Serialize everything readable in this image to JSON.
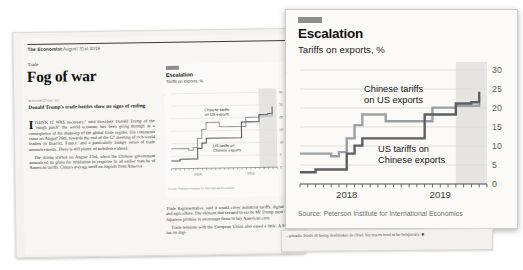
{
  "magazine": {
    "masthead_name": "The Economist",
    "masthead_date": "August 31st 2019",
    "kicker": "Trade",
    "headline": "Fog of war",
    "dateline": "WASHINGTON, DC",
    "standfirst": "Donald Trump's trade battles show no signs of ending",
    "body_left_1": "THINK IT WAS necessary,\" said President Donald Trump of the \"rough patch\" the world economy has been going through as a consequence of his shake-up of the global trade regime. His comments came on August 26th, towards the end of the G7 meeting of rich-world leaders in Biarritz, France, and a particularly bumpy series of trade announcements. There is still plenty of turbulence ahead.",
    "body_left_2": "The drama started on August 23rd, when the Chinese government announced its plans for retaliation in response to an earlier tranche of American tariffs. China's average tariff on imports from America",
    "dropcap": "I",
    "body_right_1": "Trade Representative, said it would cover industrial tariffs, digital trade and agriculture. The element that seemed to excite Mr Trump most was a Japanese promise to encourage firms to buy American corn.",
    "body_right_2": "Trade tensions with the European Union also eased a little. A French tax on digi-",
    "note_strip": "...poradic bouts of being dealmaker-in-chief, his truces tend to be temporary. ■"
  },
  "chart_data": {
    "type": "line",
    "step": true,
    "title": "Escalation",
    "subtitle": "Tariffs on exports, %",
    "source": "Source: Peterson Institute for International Economics",
    "forecast_label": "Forecast",
    "xlabel": "",
    "ylabel": "",
    "ylim": [
      0,
      30
    ],
    "yticks": [
      0,
      5,
      10,
      15,
      20,
      25,
      30
    ],
    "ytick_labels": [
      "0",
      "5",
      "10",
      "15",
      "20",
      "25",
      "30"
    ],
    "xlim": [
      "2018-01",
      "2020-01"
    ],
    "xtick_labels": [
      "2018",
      "2019"
    ],
    "grid": true,
    "legend_position": "inline-annotations",
    "forecast_band": {
      "start": "2019-09",
      "end": "2020-01",
      "color": "#e6e4e0"
    },
    "series": [
      {
        "name": "Chinese tariffs on US exports",
        "color": "#9aa0a3",
        "annotation": "Chinese tariffs\non US exports",
        "points": [
          {
            "x": "2018-01",
            "y": 8.0
          },
          {
            "x": "2018-04",
            "y": 8.0
          },
          {
            "x": "2018-05",
            "y": 7.3
          },
          {
            "x": "2018-06",
            "y": 8.4
          },
          {
            "x": "2018-07",
            "y": 12.0
          },
          {
            "x": "2018-08",
            "y": 15.5
          },
          {
            "x": "2018-09",
            "y": 18.3
          },
          {
            "x": "2018-12",
            "y": 16.5
          },
          {
            "x": "2019-06",
            "y": 20.1
          },
          {
            "x": "2019-09",
            "y": 20.6
          },
          {
            "x": "2019-12",
            "y": 21.2
          }
        ]
      },
      {
        "name": "US tariffs on Chinese exports",
        "color": "#5c5f63",
        "annotation": "US tariffs on\nChinese exports",
        "points": [
          {
            "x": "2018-01",
            "y": 3.1
          },
          {
            "x": "2018-03",
            "y": 3.8
          },
          {
            "x": "2018-07",
            "y": 8.0
          },
          {
            "x": "2018-08",
            "y": 10.1
          },
          {
            "x": "2018-09",
            "y": 12.0
          },
          {
            "x": "2019-05",
            "y": 18.3
          },
          {
            "x": "2019-06",
            "y": 18.3
          },
          {
            "x": "2019-09",
            "y": 21.2
          },
          {
            "x": "2019-11",
            "y": 21.5
          },
          {
            "x": "2019-12",
            "y": 24.3
          }
        ]
      }
    ]
  }
}
